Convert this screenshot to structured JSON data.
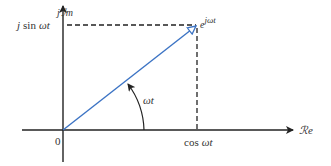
{
  "diagram": {
    "type": "phasor-diagram",
    "colors": {
      "axes": "#222222",
      "vector": "#3b73c4",
      "dashed": "#222222",
      "text": "#333333"
    },
    "labels": {
      "imag_axis_j": "j",
      "imag_axis": "ℐm",
      "real_axis": "ℛe",
      "origin": "0",
      "sin_prefix": "j",
      "sin_fn": "sin",
      "sin_arg": "ωt",
      "cos_fn": "cos",
      "cos_arg": "ωt",
      "vector_base": "e",
      "vector_exp": "jωt",
      "angle": "ωt"
    }
  }
}
